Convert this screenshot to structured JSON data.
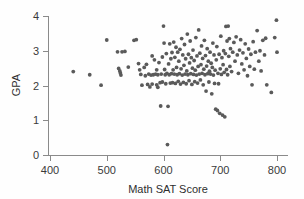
{
  "chart_data": {
    "type": "scatter",
    "title": "",
    "xlabel": "Math SAT Score",
    "ylabel": "GPA",
    "xlim": [
      390,
      810
    ],
    "ylim": [
      0,
      4
    ],
    "xticks": [
      400,
      500,
      600,
      700,
      800
    ],
    "yticks": [
      0,
      1,
      2,
      3,
      4
    ],
    "xtick_labels": [
      "400",
      "500",
      "600",
      "700",
      "800"
    ],
    "ytick_labels": [
      "0",
      "1",
      "2",
      "3",
      "4"
    ],
    "grid": false,
    "legend": null,
    "marker": {
      "shape": "circle",
      "color": "#5a5a5a",
      "radius_px": 1.9
    },
    "axis_color": "#8a8a8a",
    "background_color": "#fefefe",
    "n_points": 188,
    "points": [
      [
        441,
        2.4
      ],
      [
        470,
        2.31
      ],
      [
        490,
        2.01
      ],
      [
        500,
        3.31
      ],
      [
        519,
        2.97
      ],
      [
        521,
        2.49
      ],
      [
        523,
        2.42
      ],
      [
        524,
        2.36
      ],
      [
        525,
        2.3
      ],
      [
        527,
        2.97
      ],
      [
        532,
        2.98
      ],
      [
        538,
        2.53
      ],
      [
        548,
        3.3
      ],
      [
        552,
        3.32
      ],
      [
        556,
        2.63
      ],
      [
        558,
        2.45
      ],
      [
        560,
        2.32
      ],
      [
        562,
        2.01
      ],
      [
        566,
        2.52
      ],
      [
        568,
        2.28
      ],
      [
        570,
        2.61
      ],
      [
        572,
        2.03
      ],
      [
        574,
        2.33
      ],
      [
        576,
        1.96
      ],
      [
        578,
        2.3
      ],
      [
        580,
        2.85
      ],
      [
        580,
        2.04
      ],
      [
        582,
        2.31
      ],
      [
        584,
        2.74
      ],
      [
        586,
        2.33
      ],
      [
        588,
        2.02
      ],
      [
        588,
        2.45
      ],
      [
        590,
        1.95
      ],
      [
        590,
        2.31
      ],
      [
        592,
        2.66
      ],
      [
        594,
        2.08
      ],
      [
        595,
        1.41
      ],
      [
        596,
        2.33
      ],
      [
        598,
        2.82
      ],
      [
        598,
        2.1
      ],
      [
        600,
        3.71
      ],
      [
        601,
        3.22
      ],
      [
        602,
        2.46
      ],
      [
        603,
        2.31
      ],
      [
        604,
        2.05
      ],
      [
        605,
        2.92
      ],
      [
        606,
        2.35
      ],
      [
        607,
        0.3
      ],
      [
        608,
        1.4
      ],
      [
        609,
        2.62
      ],
      [
        610,
        2.31
      ],
      [
        611,
        3.2
      ],
      [
        612,
        2.07
      ],
      [
        613,
        2.77
      ],
      [
        614,
        2.34
      ],
      [
        615,
        2.95
      ],
      [
        616,
        2.08
      ],
      [
        617,
        2.45
      ],
      [
        618,
        3.25
      ],
      [
        619,
        2.33
      ],
      [
        620,
        2.81
      ],
      [
        621,
        2.06
      ],
      [
        622,
        3.1
      ],
      [
        623,
        2.52
      ],
      [
        624,
        2.31
      ],
      [
        625,
        2.96
      ],
      [
        626,
        2.12
      ],
      [
        627,
        2.7
      ],
      [
        628,
        2.34
      ],
      [
        629,
        3.04
      ],
      [
        630,
        2.04
      ],
      [
        631,
        2.48
      ],
      [
        632,
        3.35
      ],
      [
        633,
        2.3
      ],
      [
        634,
        2.88
      ],
      [
        635,
        2.09
      ],
      [
        636,
        2.58
      ],
      [
        637,
        3.18
      ],
      [
        638,
        2.33
      ],
      [
        639,
        2.77
      ],
      [
        640,
        2.05
      ],
      [
        641,
        2.42
      ],
      [
        642,
        3.48
      ],
      [
        643,
        2.31
      ],
      [
        644,
        2.9
      ],
      [
        645,
        2.14
      ],
      [
        646,
        2.65
      ],
      [
        647,
        3.28
      ],
      [
        648,
        2.34
      ],
      [
        649,
        2.8
      ],
      [
        650,
        2.03
      ],
      [
        651,
        2.5
      ],
      [
        652,
        3.02
      ],
      [
        653,
        2.32
      ],
      [
        654,
        2.72
      ],
      [
        655,
        2.11
      ],
      [
        656,
        2.44
      ],
      [
        657,
        3.38
      ],
      [
        658,
        2.3
      ],
      [
        659,
        2.85
      ],
      [
        660,
        2.07
      ],
      [
        661,
        2.55
      ],
      [
        662,
        3.6
      ],
      [
        663,
        2.33
      ],
      [
        664,
        2.93
      ],
      [
        665,
        2.16
      ],
      [
        666,
        2.6
      ],
      [
        667,
        3.14
      ],
      [
        668,
        2.35
      ],
      [
        669,
        2.78
      ],
      [
        670,
        2.02
      ],
      [
        671,
        2.47
      ],
      [
        672,
        3.3
      ],
      [
        673,
        2.31
      ],
      [
        674,
        2.86
      ],
      [
        675,
        1.84
      ],
      [
        676,
        2.56
      ],
      [
        677,
        3.06
      ],
      [
        678,
        2.34
      ],
      [
        679,
        2.7
      ],
      [
        680,
        2.1
      ],
      [
        681,
        2.41
      ],
      [
        682,
        2.96
      ],
      [
        683,
        2.33
      ],
      [
        684,
        2.64
      ],
      [
        685,
        1.76
      ],
      [
        686,
        2.52
      ],
      [
        687,
        3.22
      ],
      [
        688,
        2.3
      ],
      [
        689,
        2.88
      ],
      [
        690,
        2.06
      ],
      [
        691,
        2.44
      ],
      [
        692,
        1.32
      ],
      [
        693,
        2.74
      ],
      [
        694,
        3.12
      ],
      [
        695,
        1.28
      ],
      [
        696,
        2.35
      ],
      [
        697,
        2.05
      ],
      [
        698,
        2.9
      ],
      [
        699,
        1.2
      ],
      [
        700,
        2.48
      ],
      [
        701,
        3.42
      ],
      [
        702,
        2.32
      ],
      [
        703,
        2.8
      ],
      [
        704,
        1.15
      ],
      [
        705,
        2.6
      ],
      [
        706,
        3.0
      ],
      [
        707,
        2.38
      ],
      [
        708,
        1.1
      ],
      [
        709,
        2.92
      ],
      [
        710,
        3.7
      ],
      [
        711,
        2.46
      ],
      [
        712,
        3.28
      ],
      [
        713,
        2.31
      ],
      [
        714,
        3.71
      ],
      [
        715,
        2.84
      ],
      [
        716,
        3.35
      ],
      [
        717,
        2.55
      ],
      [
        718,
        3.06
      ],
      [
        720,
        2.4
      ],
      [
        722,
        2.96
      ],
      [
        724,
        3.24
      ],
      [
        726,
        2.7
      ],
      [
        728,
        3.4
      ],
      [
        730,
        2.88
      ],
      [
        732,
        2.35
      ],
      [
        734,
        3.02
      ],
      [
        736,
        3.32
      ],
      [
        738,
        2.62
      ],
      [
        740,
        2.94
      ],
      [
        742,
        2.45
      ],
      [
        744,
        3.2
      ],
      [
        746,
        2.78
      ],
      [
        748,
        2.28
      ],
      [
        750,
        3.05
      ],
      [
        752,
        2.55
      ],
      [
        754,
        2.9
      ],
      [
        756,
        2.02
      ],
      [
        758,
        3.26
      ],
      [
        760,
        2.47
      ],
      [
        762,
        2.96
      ],
      [
        765,
        3.58
      ],
      [
        768,
        2.7
      ],
      [
        770,
        3.0
      ],
      [
        772,
        2.42
      ],
      [
        775,
        3.3
      ],
      [
        778,
        2.88
      ],
      [
        780,
        3.36
      ],
      [
        782,
        2.02
      ],
      [
        790,
        1.8
      ],
      [
        796,
        3.38
      ],
      [
        799,
        3.88
      ],
      [
        800,
        2.96
      ]
    ]
  }
}
